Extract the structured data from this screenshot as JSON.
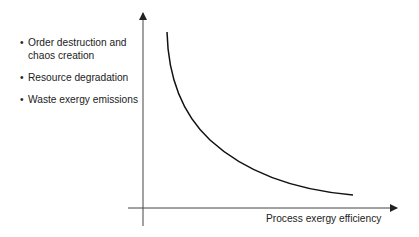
{
  "diagram": {
    "bullets": [
      {
        "marker": "•",
        "text": "Order destruction and chaos creation"
      },
      {
        "marker": "•",
        "text": "Resource degradation"
      },
      {
        "marker": "•",
        "text": "Waste exergy emissions"
      }
    ],
    "x_axis_label": "Process exergy efficiency",
    "curve": {
      "shape": "decreasing convex (inverse relationship)",
      "description": "Impacts decrease as process exergy efficiency increases"
    },
    "colors": {
      "axis": "#333333",
      "curve": "#111111",
      "text": "#222222"
    }
  }
}
